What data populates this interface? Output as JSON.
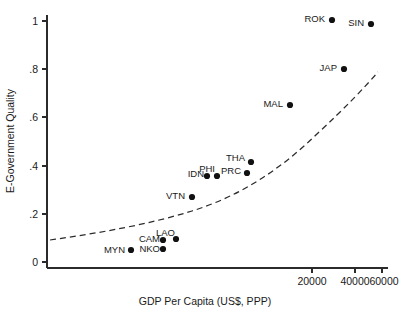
{
  "chart_data": {
    "type": "scatter",
    "title": "",
    "subtitle": "",
    "xlabel": "GDP Per Capita (US$, PPP)",
    "ylabel": "E-Government Quality",
    "x_scale": "log",
    "y_scale": "linear",
    "grid": false,
    "legend": "none",
    "xlim": [
      455,
      72000
    ],
    "ylim": [
      0,
      1.04
    ],
    "x_ticks": [
      20000,
      40000,
      60000
    ],
    "x_tick_labels": [
      "20000",
      "40000",
      "60000"
    ],
    "y_ticks": [
      0,
      0.2,
      0.4,
      0.6,
      0.8,
      1
    ],
    "y_tick_labels": [
      "0",
      ".2",
      ".4",
      ".6",
      ".8",
      "1"
    ],
    "point_labels": [
      "ROK",
      "SIN",
      "JAP",
      "MAL",
      "THA",
      "PRC",
      "PHI",
      "IDN",
      "VTN",
      "LAO",
      "CAM",
      "NKO",
      "MYN"
    ],
    "x": [
      28000,
      50000,
      34000,
      14500,
      6000,
      5700,
      3000,
      2600,
      2000,
      1400,
      1100,
      1100,
      600
    ],
    "y": [
      1.0,
      0.975,
      0.8,
      0.645,
      0.41,
      0.37,
      0.355,
      0.355,
      0.265,
      0.105,
      0.095,
      0.055,
      0.05
    ],
    "points": [
      {
        "label": "ROK",
        "gdp": 28000,
        "quality": 1.0,
        "px": 332,
        "py": 20,
        "lx": 325,
        "ly": 18
      },
      {
        "label": "SIN",
        "gdp": 50000,
        "quality": 0.975,
        "px": 371,
        "py": 24,
        "lx": 364,
        "ly": 22
      },
      {
        "label": "JAP",
        "gdp": 34000,
        "quality": 0.8,
        "px": 344,
        "py": 69,
        "lx": 337,
        "ly": 67
      },
      {
        "label": "MAL",
        "gdp": 14500,
        "quality": 0.645,
        "px": 290,
        "py": 105,
        "lx": 283,
        "ly": 103
      },
      {
        "label": "THA",
        "gdp": 6000,
        "quality": 0.41,
        "px": 251,
        "py": 162,
        "lx": 245,
        "ly": 157
      },
      {
        "label": "PRC",
        "gdp": 5700,
        "quality": 0.37,
        "px": 247,
        "py": 173,
        "lx": 241,
        "ly": 170
      },
      {
        "label": "PHI",
        "gdp": 3000,
        "quality": 0.355,
        "px": 217,
        "py": 176,
        "lx": 215,
        "ly": 168
      },
      {
        "label": "IDN",
        "gdp": 2600,
        "quality": 0.355,
        "px": 207,
        "py": 176,
        "lx": 204,
        "ly": 173
      },
      {
        "label": "VTN",
        "gdp": 2000,
        "quality": 0.265,
        "px": 192,
        "py": 197,
        "lx": 185,
        "ly": 195
      },
      {
        "label": "LAO",
        "gdp": 1400,
        "quality": 0.105,
        "px": 176,
        "py": 239,
        "lx": 175,
        "ly": 232
      },
      {
        "label": "CAM",
        "gdp": 1100,
        "quality": 0.095,
        "px": 163,
        "py": 240,
        "lx": 160,
        "ly": 238
      },
      {
        "label": "NKO",
        "gdp": 1100,
        "quality": 0.055,
        "px": 163,
        "py": 249,
        "lx": 160,
        "ly": 248
      },
      {
        "label": "MYN",
        "gdp": 600,
        "quality": 0.05,
        "px": 131,
        "py": 250,
        "lx": 125,
        "ly": 249
      }
    ],
    "fit_line": {
      "style": "dashed",
      "description": "fitted exponential trend",
      "path": "M 50,240 C 100,233 150,224 192,211 C 240,196 280,170 318,133 C 345,108 365,87 378,72"
    },
    "colors": {
      "background": "#ffffff",
      "axis": "#2b2b2b",
      "marker": "#111111",
      "text": "#1a1a1a",
      "fit_line": "#2b2b2b"
    }
  }
}
